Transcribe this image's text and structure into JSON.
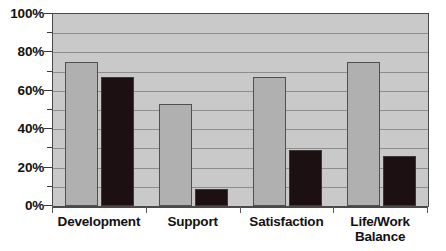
{
  "chart_data": {
    "type": "bar",
    "title": "",
    "subtitle": "",
    "xlabel": "",
    "ylabel": "",
    "categories": [
      "Development",
      "Support",
      "Satisfaction",
      "Life/Work\nBalance"
    ],
    "series": [
      {
        "name": "series-a",
        "color": "#b0b0b0",
        "values": [
          75,
          53,
          67,
          75
        ]
      },
      {
        "name": "series-b",
        "color": "#1c1012",
        "values": [
          67,
          9,
          29,
          26
        ]
      }
    ],
    "ylim": [
      0,
      100
    ],
    "y_ticks": [
      0,
      20,
      40,
      60,
      80,
      100
    ],
    "y_tick_labels": [
      "0%",
      "20%",
      "40%",
      "60%",
      "80%",
      "100%"
    ],
    "y_minor_ticks": [
      10,
      30,
      50,
      70,
      90
    ],
    "gridlines": [
      10,
      20,
      30,
      40,
      50,
      60,
      70,
      80,
      90
    ],
    "grid": true,
    "legend": "none",
    "plot_background": "#c9c9c9",
    "grid_color": "#8d8d8d",
    "axis_color": "#4a4a4a"
  }
}
